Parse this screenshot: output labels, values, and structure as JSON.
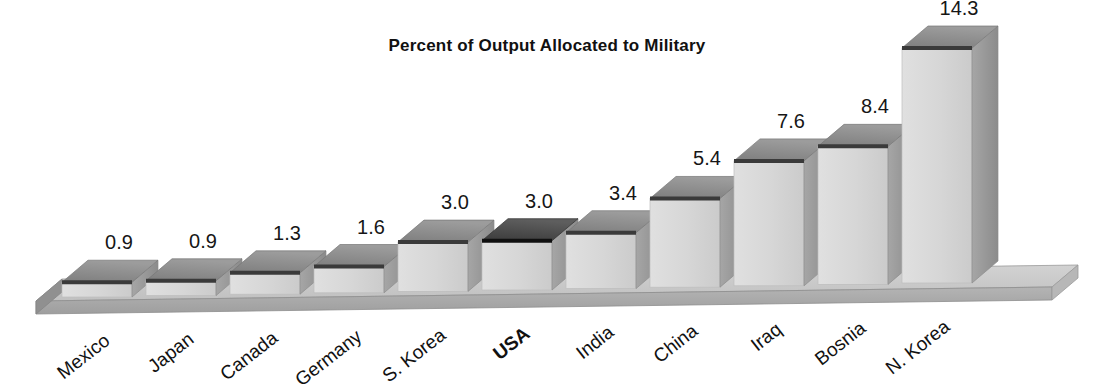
{
  "chart_data": {
    "type": "bar",
    "title": "Percent of Output Allocated to Military",
    "xlabel": "",
    "ylabel": "",
    "ylim": [
      0,
      14.3
    ],
    "grid": false,
    "legend": "none",
    "style": "3d-bar",
    "categories": [
      "Mexico",
      "Japan",
      "Canada",
      "Germany",
      "S. Korea",
      "USA",
      "India",
      "China",
      "Iraq",
      "Bosnia",
      "N. Korea"
    ],
    "values": [
      0.9,
      0.9,
      1.3,
      1.6,
      3.0,
      3.0,
      3.4,
      5.4,
      7.6,
      8.4,
      14.3
    ],
    "value_labels": [
      "0.9",
      "0.9",
      "1.3",
      "1.6",
      "3.0",
      "3.0",
      "3.4",
      "5.4",
      "7.6",
      "8.4",
      "14.3"
    ],
    "highlighted_category": "USA",
    "label_rotation_deg": -38
  },
  "title": {
    "text": "Percent of Output Allocated to Military"
  },
  "bars": [
    {
      "label": "Mexico",
      "value": 0.9,
      "value_label": "0.9",
      "bold": false
    },
    {
      "label": "Japan",
      "value": 0.9,
      "value_label": "0.9",
      "bold": false
    },
    {
      "label": "Canada",
      "value": 1.3,
      "value_label": "1.3",
      "bold": false
    },
    {
      "label": "Germany",
      "value": 1.6,
      "value_label": "1.6",
      "bold": false
    },
    {
      "label": "S. Korea",
      "value": 3.0,
      "value_label": "3.0",
      "bold": false
    },
    {
      "label": "USA",
      "value": 3.0,
      "value_label": "3.0",
      "bold": true
    },
    {
      "label": "India",
      "value": 3.4,
      "value_label": "3.4",
      "bold": false
    },
    {
      "label": "China",
      "value": 5.4,
      "value_label": "5.4",
      "bold": false
    },
    {
      "label": "Iraq",
      "value": 7.6,
      "value_label": "7.6",
      "bold": false
    },
    {
      "label": "Bosnia",
      "value": 8.4,
      "value_label": "8.4",
      "bold": false
    },
    {
      "label": "N. Korea",
      "value": 14.3,
      "value_label": "14.3",
      "bold": false
    }
  ],
  "colors": {
    "background": "#ffffff",
    "bar_front": "#d5d5d5",
    "bar_front_dark": "#c9c9c9",
    "bar_top": "#8d8d8d",
    "bar_top_highlight": "#4a4a4a",
    "bar_side": "#9b9b9b",
    "bar_edge": "#3a3a3a",
    "floor_top": "#c9c9c9",
    "floor_front": "#a9a9a9",
    "floor_left": "#8f8f8f",
    "text": "#111111"
  }
}
